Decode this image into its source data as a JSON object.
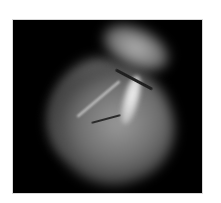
{
  "figure": {
    "description": "Grayscale volume-rendered image of a heart on a black background",
    "background_color": "#000000",
    "border_color": "#d8d8d8"
  }
}
